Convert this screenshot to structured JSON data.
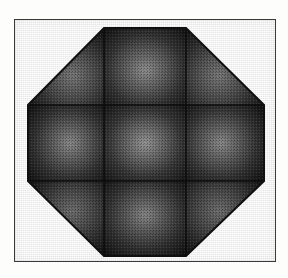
{
  "figure": {
    "title": "Shaded octagon composed of a three-by-three grid of panels",
    "kind": "rendered-geometric-solid",
    "background_color": "#fdfdfc",
    "frame": {
      "border_color": "#3a3a3a",
      "border_width_px": 1.5,
      "x": 14,
      "y": 19,
      "width": 262,
      "height": 243
    },
    "shape": {
      "name": "octagon",
      "sides": 8,
      "fill_color": "#2a2a2a",
      "edge_color": "#101010",
      "grid_line_color": "#0d0d0d",
      "highlight_color": "#8e8e8e",
      "shadow_color": "#141414",
      "vertices": [
        [
          89,
          8
        ],
        [
          171,
          8
        ],
        [
          249,
          85
        ],
        [
          249,
          161
        ],
        [
          171,
          236
        ],
        [
          89,
          236
        ],
        [
          13,
          161
        ],
        [
          13,
          85
        ]
      ],
      "grid": {
        "rows": 3,
        "columns": 3,
        "cell_count": 9,
        "vertical_divider_x": [
          89,
          171
        ],
        "horizontal_divider_y": [
          85,
          161
        ]
      }
    },
    "panels": [
      {
        "id": "panel-top-left",
        "row": 0,
        "column": 0,
        "clipped_corner": "top-left",
        "highlight_x_pct": 58,
        "highlight_y_pct": 62,
        "peak_brightness": "#787878"
      },
      {
        "id": "panel-top-center",
        "row": 0,
        "column": 1,
        "clipped_corner": "none",
        "highlight_x_pct": 50,
        "highlight_y_pct": 55,
        "peak_brightness": "#8e8e8e"
      },
      {
        "id": "panel-top-right",
        "row": 0,
        "column": 2,
        "clipped_corner": "top-right",
        "highlight_x_pct": 42,
        "highlight_y_pct": 62,
        "peak_brightness": "#787878"
      },
      {
        "id": "panel-middle-left",
        "row": 1,
        "column": 0,
        "clipped_corner": "none",
        "highlight_x_pct": 55,
        "highlight_y_pct": 50,
        "peak_brightness": "#8a8a8a"
      },
      {
        "id": "panel-center",
        "row": 1,
        "column": 1,
        "clipped_corner": "none",
        "highlight_x_pct": 50,
        "highlight_y_pct": 50,
        "peak_brightness": "#969696"
      },
      {
        "id": "panel-middle-right",
        "row": 1,
        "column": 2,
        "clipped_corner": "none",
        "highlight_x_pct": 45,
        "highlight_y_pct": 50,
        "peak_brightness": "#8a8a8a"
      },
      {
        "id": "panel-bottom-left",
        "row": 2,
        "column": 0,
        "clipped_corner": "bottom-left",
        "highlight_x_pct": 58,
        "highlight_y_pct": 40,
        "peak_brightness": "#6e6e6e"
      },
      {
        "id": "panel-bottom-center",
        "row": 2,
        "column": 1,
        "clipped_corner": "none",
        "highlight_x_pct": 50,
        "highlight_y_pct": 45,
        "peak_brightness": "#868686"
      },
      {
        "id": "panel-bottom-right",
        "row": 2,
        "column": 2,
        "clipped_corner": "bottom-right",
        "highlight_x_pct": 42,
        "highlight_y_pct": 40,
        "peak_brightness": "#6e6e6e"
      }
    ]
  }
}
